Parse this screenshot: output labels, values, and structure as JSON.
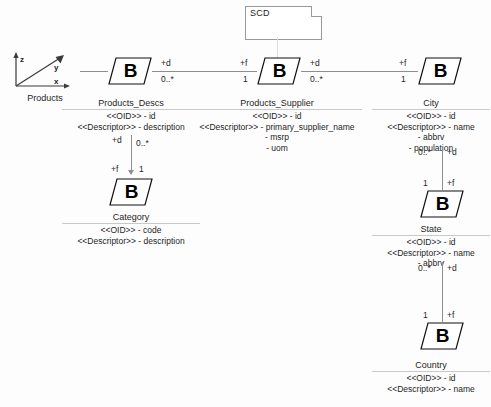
{
  "diagram": {
    "note": {
      "label": "SCD"
    },
    "source": {
      "caption": "Products",
      "axis_labels": {
        "z": "z",
        "y": "y",
        "x": "x"
      }
    },
    "fact_symbol": "B",
    "classes": [
      {
        "id": "products_descs",
        "name": "Products_Descs",
        "attributes": [
          "<<OID>> - id",
          "<<Descriptor>> - description"
        ]
      },
      {
        "id": "products_supplier",
        "name": "Products_Supplier",
        "attributes": [
          "<<OID>> - id",
          "<<Descriptor>> - primary_supplier_name",
          "- msrp",
          "- uom"
        ]
      },
      {
        "id": "city",
        "name": "City",
        "attributes": [
          "<<OID>> - id",
          "<<Descriptor>> - name",
          "- abbrv",
          "- population"
        ]
      },
      {
        "id": "category",
        "name": "Category",
        "attributes": [
          "<<OID>> - code",
          "<<Descriptor>> - description"
        ]
      },
      {
        "id": "state",
        "name": "State",
        "attributes": [
          "<<OID>> - id",
          "<<Descriptor>> - name",
          "- abbrv"
        ]
      },
      {
        "id": "country",
        "name": "Country",
        "attributes": [
          "<<OID>> - id",
          "<<Descriptor>> - name"
        ]
      }
    ],
    "associations": {
      "descs_to_supplier": {
        "source_role": "+d",
        "source_mult": "0..*",
        "target_role": "+f",
        "target_mult": "1"
      },
      "supplier_to_city": {
        "source_role": "+d",
        "source_mult": "0..*",
        "target_role": "+f",
        "target_mult": "1"
      },
      "descs_to_category": {
        "source_role": "+d",
        "source_mult": "0..*",
        "target_role": "+f",
        "target_mult": "1"
      },
      "city_to_state": {
        "source_mult": "0..*",
        "source_role": "+d",
        "target_mult": "1",
        "target_role": "+f"
      },
      "state_to_country": {
        "source_mult": "0..*",
        "source_role": "+d",
        "target_mult": "1",
        "target_role": "+f"
      }
    },
    "colors": {
      "line": "#8e8e8e",
      "note_border": "#9a9a9a",
      "text": "#1d1d1d",
      "background": "#fdfdfd"
    }
  }
}
